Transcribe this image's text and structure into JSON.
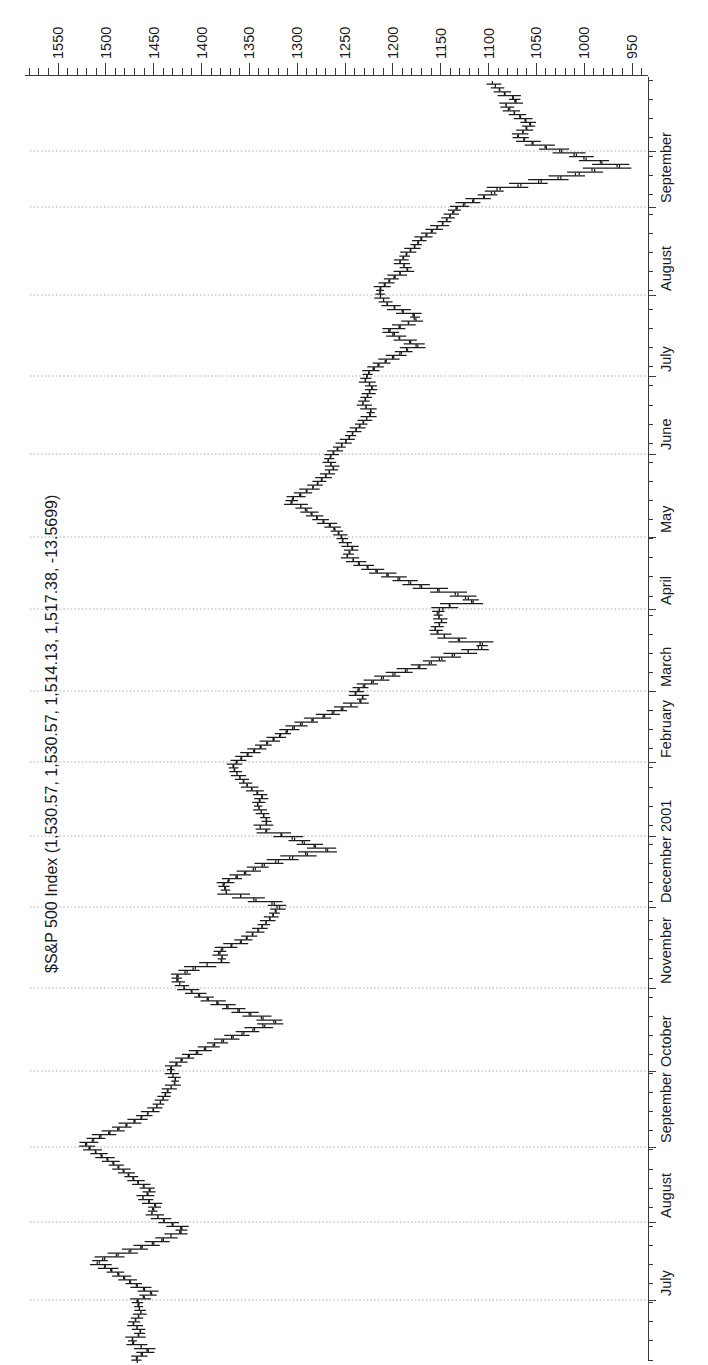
{
  "window": {
    "background": "#ffffff"
  },
  "chart_data": {
    "type": "ohlc_bar",
    "orientation": "rotated_90_ccw",
    "title": "$S&P 500 Index (1,530.57, 1,530.57, 1,514.13, 1,517.38, -13.5699)",
    "instrument": "$S&P 500 Index",
    "readout_values": {
      "open": "1,530.57",
      "high": "1,530.57",
      "low": "1,514.13",
      "close": "1,517.38",
      "change": "-13.5699"
    },
    "y_axis": {
      "side": "right",
      "major_step": 50,
      "minor_step": 10,
      "label_min": 950,
      "label_max": 1550,
      "tick_value_min": 940,
      "tick_value_max": 1580,
      "labels": [
        "1550",
        "1500",
        "1450",
        "1400",
        "1350",
        "1300",
        "1250",
        "1200",
        "1150",
        "1100",
        "1050",
        "1000",
        "950"
      ]
    },
    "x_axis": {
      "period": "June 2000 - October 2001",
      "months": [
        {
          "label": "July",
          "x": 65
        },
        {
          "label": "August",
          "x": 143
        },
        {
          "label": "September",
          "x": 218
        },
        {
          "label": "October",
          "x": 294
        },
        {
          "label": "November",
          "x": 377
        },
        {
          "label": "December",
          "x": 458
        },
        {
          "label": "2001",
          "x": 529
        },
        {
          "label": "February",
          "x": 603
        },
        {
          "label": "March",
          "x": 674
        },
        {
          "label": "April",
          "x": 756
        },
        {
          "label": "May",
          "x": 828
        },
        {
          "label": "June",
          "x": 911
        },
        {
          "label": "July",
          "x": 989
        },
        {
          "label": "August",
          "x": 1070
        },
        {
          "label": "September",
          "x": 1158
        },
        {
          "label": "",
          "x": 1214
        }
      ]
    },
    "gridlines": {
      "style": "dashed",
      "at": "month_starts"
    },
    "price_scale": {
      "y_at_1550": 58,
      "px_per_point": 0.9567
    },
    "plot": {
      "axis_x_right": 1290,
      "axis_y_bottom": 648,
      "axis_top": 25,
      "time_axis_x_start": 5,
      "time_axis_x_end": 1288,
      "week_tick_step": 19.1
    },
    "series": {
      "name": "S&P 500 daily high-low-close bars",
      "bar_step_px": 3.82,
      "x_start": 5,
      "x_end": 1281,
      "anchors_px_price": [
        [
          5,
          1468
        ],
        [
          13,
          1455
        ],
        [
          22,
          1476
        ],
        [
          30,
          1462
        ],
        [
          40,
          1472
        ],
        [
          50,
          1463
        ],
        [
          62,
          1468
        ],
        [
          70,
          1452
        ],
        [
          80,
          1472
        ],
        [
          90,
          1488
        ],
        [
          102,
          1512
        ],
        [
          110,
          1482
        ],
        [
          120,
          1450
        ],
        [
          128,
          1430
        ],
        [
          133,
          1416
        ],
        [
          143,
          1440
        ],
        [
          150,
          1452
        ],
        [
          158,
          1448
        ],
        [
          165,
          1462
        ],
        [
          172,
          1452
        ],
        [
          180,
          1465
        ],
        [
          190,
          1478
        ],
        [
          200,
          1492
        ],
        [
          210,
          1508
        ],
        [
          218,
          1523
        ],
        [
          226,
          1508
        ],
        [
          234,
          1488
        ],
        [
          243,
          1468
        ],
        [
          252,
          1452
        ],
        [
          262,
          1442
        ],
        [
          272,
          1436
        ],
        [
          282,
          1426
        ],
        [
          294,
          1434
        ],
        [
          304,
          1420
        ],
        [
          314,
          1398
        ],
        [
          324,
          1374
        ],
        [
          333,
          1348
        ],
        [
          341,
          1322
        ],
        [
          348,
          1346
        ],
        [
          357,
          1374
        ],
        [
          366,
          1398
        ],
        [
          377,
          1421
        ],
        [
          386,
          1428
        ],
        [
          395,
          1408
        ],
        [
          403,
          1376
        ],
        [
          412,
          1384
        ],
        [
          421,
          1360
        ],
        [
          432,
          1342
        ],
        [
          443,
          1330
        ],
        [
          452,
          1322
        ],
        [
          458,
          1316
        ],
        [
          464,
          1346
        ],
        [
          471,
          1374
        ],
        [
          480,
          1378
        ],
        [
          489,
          1358
        ],
        [
          498,
          1336
        ],
        [
          507,
          1302
        ],
        [
          513,
          1268
        ],
        [
          519,
          1288
        ],
        [
          525,
          1304
        ],
        [
          530,
          1322
        ],
        [
          534,
          1342
        ],
        [
          541,
          1330
        ],
        [
          549,
          1336
        ],
        [
          558,
          1342
        ],
        [
          567,
          1336
        ],
        [
          576,
          1350
        ],
        [
          586,
          1360
        ],
        [
          596,
          1368
        ],
        [
          603,
          1362
        ],
        [
          611,
          1348
        ],
        [
          620,
          1332
        ],
        [
          629,
          1316
        ],
        [
          638,
          1300
        ],
        [
          647,
          1272
        ],
        [
          656,
          1250
        ],
        [
          664,
          1228
        ],
        [
          670,
          1240
        ],
        [
          676,
          1234
        ],
        [
          683,
          1218
        ],
        [
          690,
          1196
        ],
        [
          698,
          1168
        ],
        [
          706,
          1146
        ],
        [
          712,
          1120
        ],
        [
          718,
          1098
        ],
        [
          725,
          1142
        ],
        [
          733,
          1158
        ],
        [
          741,
          1148
        ],
        [
          749,
          1154
        ],
        [
          756,
          1150
        ],
        [
          762,
          1112
        ],
        [
          769,
          1132
        ],
        [
          776,
          1168
        ],
        [
          784,
          1192
        ],
        [
          791,
          1214
        ],
        [
          799,
          1234
        ],
        [
          807,
          1248
        ],
        [
          815,
          1242
        ],
        [
          822,
          1252
        ],
        [
          828,
          1254
        ],
        [
          837,
          1264
        ],
        [
          846,
          1280
        ],
        [
          856,
          1294
        ],
        [
          862,
          1310
        ],
        [
          869,
          1296
        ],
        [
          877,
          1282
        ],
        [
          886,
          1272
        ],
        [
          895,
          1262
        ],
        [
          903,
          1268
        ],
        [
          911,
          1262
        ],
        [
          921,
          1250
        ],
        [
          931,
          1241
        ],
        [
          941,
          1231
        ],
        [
          951,
          1221
        ],
        [
          959,
          1232
        ],
        [
          967,
          1227
        ],
        [
          976,
          1221
        ],
        [
          983,
          1229
        ],
        [
          990,
          1226
        ],
        [
          998,
          1216
        ],
        [
          1006,
          1200
        ],
        [
          1013,
          1186
        ],
        [
          1018,
          1172
        ],
        [
          1025,
          1193
        ],
        [
          1032,
          1206
        ],
        [
          1039,
          1186
        ],
        [
          1046,
          1172
        ],
        [
          1053,
          1193
        ],
        [
          1060,
          1207
        ],
        [
          1067,
          1213
        ],
        [
          1074,
          1214
        ],
        [
          1081,
          1206
        ],
        [
          1088,
          1196
        ],
        [
          1094,
          1184
        ],
        [
          1101,
          1193
        ],
        [
          1109,
          1186
        ],
        [
          1117,
          1177
        ],
        [
          1125,
          1170
        ],
        [
          1133,
          1158
        ],
        [
          1141,
          1146
        ],
        [
          1149,
          1139
        ],
        [
          1156,
          1133
        ],
        [
          1162,
          1118
        ],
        [
          1168,
          1100
        ],
        [
          1174,
          1091
        ],
        [
          1180,
          1056
        ],
        [
          1186,
          1024
        ],
        [
          1192,
          996
        ],
        [
          1197,
          962
        ],
        [
          1203,
          994
        ],
        [
          1209,
          1010
        ],
        [
          1215,
          1036
        ],
        [
          1221,
          1058
        ],
        [
          1227,
          1070
        ],
        [
          1233,
          1062
        ],
        [
          1239,
          1056
        ],
        [
          1245,
          1064
        ],
        [
          1251,
          1074
        ],
        [
          1257,
          1084
        ],
        [
          1263,
          1068
        ],
        [
          1270,
          1084
        ],
        [
          1276,
          1092
        ],
        [
          1281,
          1096
        ]
      ],
      "notable_points": [
        {
          "date": "2000-09-01",
          "note": "peak",
          "price": 1530
        },
        {
          "date": "2000-10-18",
          "note": "autumn low",
          "price": 1305
        },
        {
          "date": "2000-12-21",
          "note": "December low",
          "price": 1254
        },
        {
          "date": "2001-03-22",
          "note": "March low",
          "price": 1081
        },
        {
          "date": "2001-05-22",
          "note": "spring high",
          "price": 1315
        },
        {
          "date": "2001-09-21",
          "note": "post-9/11 low",
          "price": 945
        }
      ]
    }
  },
  "colors": {
    "background": "#ffffff",
    "bars": "#1c1c1c",
    "axis": "#3a3a3a",
    "grid": "#aaaaaa",
    "text": "#1a1a1a"
  }
}
